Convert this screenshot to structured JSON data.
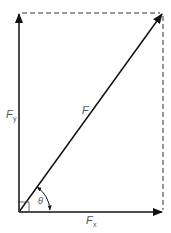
{
  "diagram": {
    "colors": {
      "line": "#111111",
      "dashed": "#333333",
      "label": "#555555",
      "background": "#ffffff"
    },
    "labels": {
      "resultant": "F",
      "x_component_main": "F",
      "x_component_sub": "x",
      "y_component_main": "F",
      "y_component_sub": "y",
      "angle": "θ"
    },
    "elements": [
      {
        "type": "arrow",
        "name": "resultant-force",
        "from": [
          19,
          212
        ],
        "to": [
          163,
          13
        ]
      },
      {
        "type": "arrow",
        "name": "x-component",
        "from": [
          19,
          212
        ],
        "to": [
          163,
          212
        ]
      },
      {
        "type": "arrow",
        "name": "y-component",
        "from": [
          19,
          212
        ],
        "to": [
          19,
          13
        ]
      },
      {
        "type": "dashed-line",
        "name": "top-projection",
        "from": [
          19,
          13
        ],
        "to": [
          163,
          13
        ]
      },
      {
        "type": "dashed-line",
        "name": "right-projection",
        "from": [
          163,
          13
        ],
        "to": [
          163,
          212
        ]
      },
      {
        "type": "right-angle-marker",
        "at": [
          19,
          212
        ]
      },
      {
        "type": "angle-arc",
        "label": "θ",
        "between": [
          "x-component",
          "resultant-force"
        ]
      }
    ]
  }
}
